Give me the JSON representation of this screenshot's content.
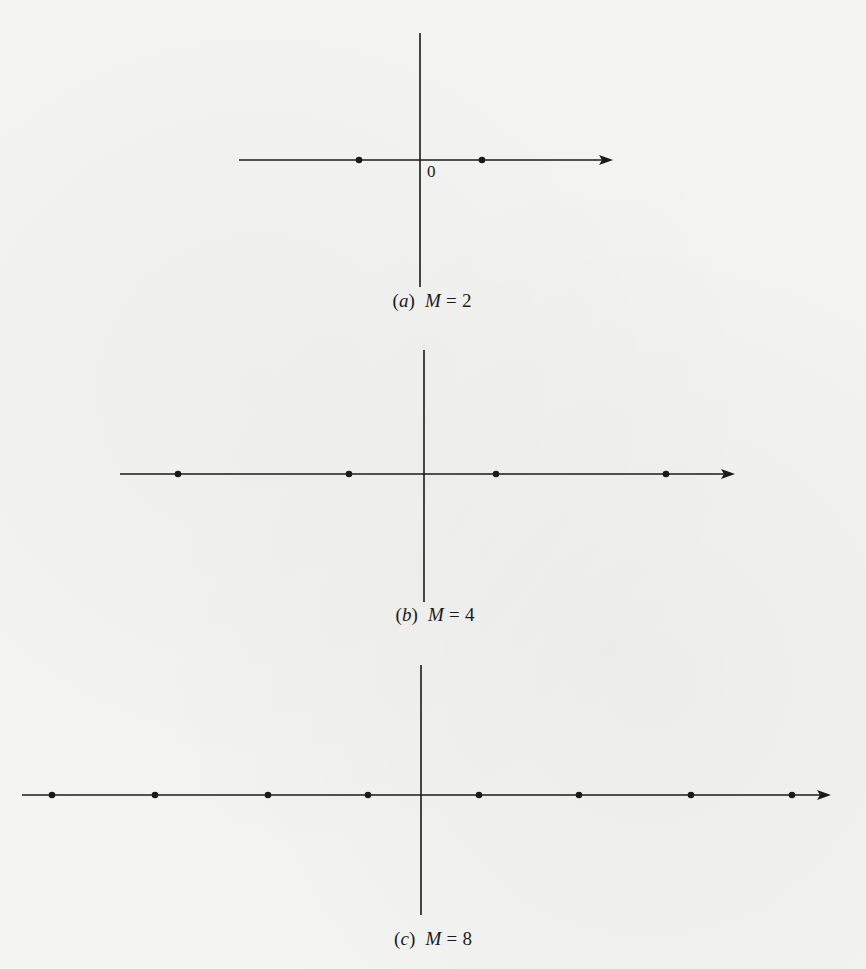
{
  "figure": {
    "panels": [
      {
        "id": "a",
        "letter": "a",
        "variable": "M",
        "equals": "=",
        "value": "2",
        "origin_label": "0",
        "axis": {
          "cx": 420,
          "cy": 160,
          "h_left": 239,
          "h_right": 613,
          "v_top": 33,
          "v_bottom": 287
        },
        "points_x": [
          359,
          482
        ],
        "caption_pos": {
          "x": 432,
          "y": 290
        }
      },
      {
        "id": "b",
        "letter": "b",
        "variable": "M",
        "equals": "=",
        "value": "4",
        "origin_label": "",
        "axis": {
          "cx": 424,
          "cy": 474,
          "h_left": 120,
          "h_right": 735,
          "v_top": 350,
          "v_bottom": 602
        },
        "points_x": [
          178,
          349,
          496,
          666
        ],
        "caption_pos": {
          "x": 435,
          "y": 604
        }
      },
      {
        "id": "c",
        "letter": "c",
        "variable": "M",
        "equals": "=",
        "value": "8",
        "origin_label": "",
        "axis": {
          "cx": 421,
          "cy": 795,
          "h_left": 22,
          "h_right": 831,
          "v_top": 665,
          "v_bottom": 915
        },
        "points_x": [
          52,
          155,
          268,
          368,
          479,
          579,
          691,
          792
        ],
        "caption_pos": {
          "x": 433,
          "y": 928
        }
      }
    ],
    "colors": {
      "ink": "#1a1a1a",
      "paper": "#f4f4f2"
    }
  },
  "chart_data": [
    {
      "type": "scatter",
      "title": "(a) M = 2",
      "xlabel": "",
      "ylabel": "",
      "x": [
        -1,
        1
      ],
      "y": [
        0,
        0
      ],
      "annotations": [
        "0 (origin)"
      ],
      "grid": false
    },
    {
      "type": "scatter",
      "title": "(b) M = 4",
      "xlabel": "",
      "ylabel": "",
      "x": [
        -3,
        -1,
        1,
        3
      ],
      "y": [
        0,
        0,
        0,
        0
      ],
      "grid": false
    },
    {
      "type": "scatter",
      "title": "(c) M = 8",
      "xlabel": "",
      "ylabel": "",
      "x": [
        -7,
        -5,
        -3,
        -1,
        1,
        3,
        5,
        7
      ],
      "y": [
        0,
        0,
        0,
        0,
        0,
        0,
        0,
        0
      ],
      "grid": false
    }
  ]
}
